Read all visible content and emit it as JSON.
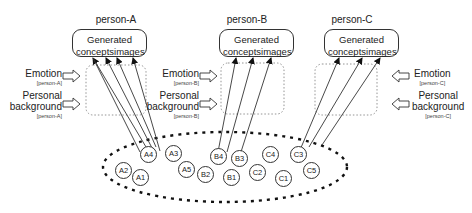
{
  "persons": [
    {
      "id": "person-A",
      "title": "person-A",
      "generated": {
        "line1": "Generated",
        "concepts": "concepts",
        "images": "images"
      },
      "emotion": {
        "label": "Emotion",
        "sub": "[person-A]"
      },
      "background": {
        "label1": "Personal",
        "label2": "background",
        "sub": "[person-A]"
      },
      "side": "left"
    },
    {
      "id": "person-B",
      "title": "person-B",
      "generated": {
        "line1": "Generated",
        "concepts": "concepts",
        "images": "images"
      },
      "emotion": {
        "label": "Emotion",
        "sub": "[person-B]"
      },
      "background": {
        "label1": "Personal",
        "label2": "background",
        "sub": "[person-B]"
      },
      "side": "left"
    },
    {
      "id": "person-C",
      "title": "person-C",
      "generated": {
        "line1": "Generated",
        "concepts": "concepts",
        "images": "images"
      },
      "emotion": {
        "label": "Emotion",
        "sub": "[person-C]"
      },
      "background": {
        "label1": "Personal",
        "label2": "background",
        "sub": "[person-C]"
      },
      "side": "right"
    }
  ],
  "nodes": [
    {
      "label": "A1",
      "x": 141,
      "y": 178
    },
    {
      "label": "A2",
      "x": 124,
      "y": 171
    },
    {
      "label": "A3",
      "x": 174,
      "y": 154
    },
    {
      "label": "A4",
      "x": 149,
      "y": 155
    },
    {
      "label": "A5",
      "x": 187,
      "y": 170
    },
    {
      "label": "B1",
      "x": 232,
      "y": 178
    },
    {
      "label": "B2",
      "x": 206,
      "y": 175
    },
    {
      "label": "B3",
      "x": 240,
      "y": 159
    },
    {
      "label": "B4",
      "x": 219,
      "y": 157
    },
    {
      "label": "C1",
      "x": 284,
      "y": 179
    },
    {
      "label": "C2",
      "x": 258,
      "y": 173
    },
    {
      "label": "C3",
      "x": 299,
      "y": 155
    },
    {
      "label": "C4",
      "x": 271,
      "y": 155
    },
    {
      "label": "C5",
      "x": 312,
      "y": 171
    }
  ],
  "colors": {
    "stroke": "#333333",
    "dotted": "#888888",
    "text": "#222222",
    "background": "#ffffff"
  }
}
